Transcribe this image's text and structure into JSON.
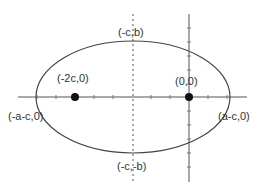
{
  "diagram": {
    "type": "ellipse-coordinate-diagram",
    "colors": {
      "curve": "#444444",
      "axis": "#555555",
      "point": "#111111",
      "text": "#333333"
    },
    "ellipse": {
      "cx": 133,
      "cy": 97,
      "rx": 97,
      "ry": 56
    },
    "labels": {
      "top": "(-c,b)",
      "bottom": "(-c,-b)",
      "left": "(-a-c,0)",
      "right": "(a-c,0)",
      "focus_left": "(-2c,0)",
      "origin": "(0,0)"
    },
    "points": [
      {
        "name": "focus-left",
        "x": 75,
        "y": 97
      },
      {
        "name": "origin",
        "x": 189,
        "y": 97
      }
    ]
  }
}
